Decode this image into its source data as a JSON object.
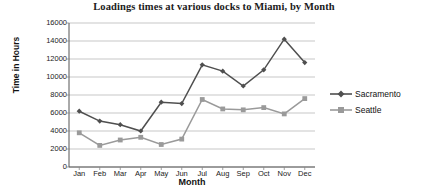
{
  "chart_data": {
    "type": "line",
    "title": "Loadings times at various docks to Miami, by Month",
    "xlabel": "Month",
    "ylabel": "Time in Hours",
    "categories": [
      "Jan",
      "Feb",
      "Mar",
      "Apr",
      "May",
      "Jun",
      "Jul",
      "Aug",
      "Sep",
      "Oct",
      "Nov",
      "Dec"
    ],
    "series": [
      {
        "name": "Sacramento",
        "color": "#4f4f4f",
        "marker": "diamond",
        "values": [
          6200,
          5100,
          4700,
          4000,
          7200,
          7050,
          11350,
          10650,
          9000,
          10800,
          14200,
          11600
        ]
      },
      {
        "name": "Seattle",
        "color": "#9a9a9a",
        "marker": "square",
        "values": [
          3800,
          2400,
          3000,
          3300,
          2500,
          3100,
          7500,
          6450,
          6350,
          6600,
          5900,
          7600
        ]
      }
    ],
    "ylim": [
      0,
      16000
    ],
    "ytick_step": 2000,
    "yticks": [
      "16000",
      "14000",
      "12000",
      "10000",
      "8000",
      "6000",
      "4000",
      "2000",
      "0"
    ],
    "grid": "horizontal",
    "legend_position": "right"
  },
  "legend": {
    "items": [
      {
        "label": "Sacramento"
      },
      {
        "label": "Seattle"
      }
    ]
  }
}
